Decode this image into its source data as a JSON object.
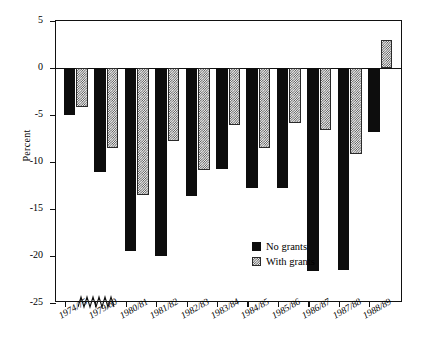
{
  "chart_data": {
    "type": "bar",
    "title": "",
    "subtitle": "",
    "xlabel": "",
    "ylabel": "Percent",
    "ylim": [
      -25,
      5
    ],
    "yticks": [
      5,
      0,
      -5,
      -10,
      -15,
      -20,
      -25
    ],
    "ytick_labels": [
      "5",
      "0",
      "-5",
      "-10",
      "-15",
      "-20",
      "-25"
    ],
    "grid": false,
    "axis_break": true,
    "axis_break_note": "zigzag break on x-axis between 1974/75 and 1979/80",
    "legend_position": "center-right inside plot",
    "categories": [
      "1974/75",
      "1979/80",
      "1980/81",
      "1981/82",
      "1982/83",
      "1983/84",
      "1984/85",
      "1985/86",
      "1986/87",
      "1987/88",
      "1988/89"
    ],
    "series": [
      {
        "name": "No grants",
        "fill": "solid-black",
        "color": "#0d0d0d",
        "values": [
          -5.0,
          -11.1,
          -19.5,
          -20.0,
          -13.6,
          -10.7,
          -12.8,
          -12.8,
          -21.6,
          -21.5,
          -6.8
        ]
      },
      {
        "name": "With grants",
        "fill": "stipple-checker",
        "color": "#cfcfcf",
        "values": [
          -4.1,
          -8.5,
          -13.5,
          -7.8,
          -10.8,
          -6.1,
          -8.5,
          -5.9,
          -6.6,
          -9.2,
          3.0
        ]
      }
    ]
  },
  "legend": {
    "items": [
      {
        "label": "No grants"
      },
      {
        "label": "With grants"
      }
    ]
  }
}
